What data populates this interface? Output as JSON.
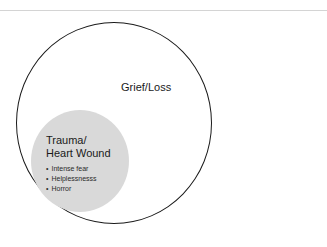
{
  "diagram": {
    "outer_circle": {
      "label": "Grief/Loss",
      "stroke": "#1a1a1a",
      "fill": "#ffffff"
    },
    "inner_circle": {
      "title_line1": "Trauma/",
      "title_line2": "Heart Wound",
      "fill": "#d9d9d9",
      "bullets": [
        "Intense fear",
        "Helplessnesss",
        "Horror"
      ]
    }
  }
}
